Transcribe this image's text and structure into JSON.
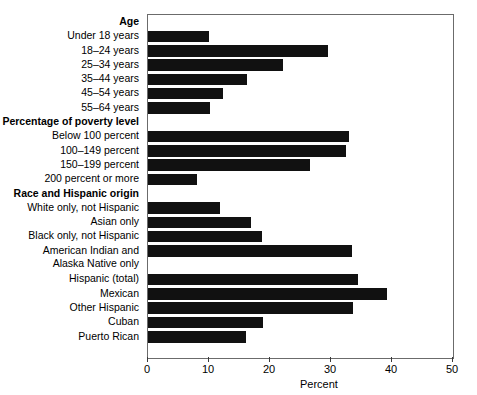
{
  "chart_data": {
    "type": "bar",
    "orientation": "horizontal",
    "title": "",
    "xlabel": "Percent",
    "ylabel": "",
    "xlim": [
      0,
      50
    ],
    "xticks": [
      0,
      10,
      20,
      30,
      40,
      50
    ],
    "grid": false,
    "legend": false,
    "categories": [
      "Age",
      "Under 18 years",
      "18–24 years",
      "25–34 years",
      "35–44 years",
      "45–54 years",
      "55–64 years",
      "Percentage of poverty level",
      "Below 100 percent",
      "100–149 percent",
      "150–199 percent",
      "200 percent or more",
      "Race and Hispanic origin",
      "White only, not Hispanic",
      "Asian only",
      "Black only, not Hispanic",
      "American Indian and Alaska Native only",
      "Hispanic (total)",
      "Mexican",
      "Other Hispanic",
      "Cuban",
      "Puerto Rican"
    ],
    "values": [
      null,
      10.0,
      29.5,
      22.1,
      16.2,
      12.3,
      10.2,
      null,
      33.0,
      32.5,
      26.5,
      8.0,
      null,
      11.8,
      16.9,
      18.7,
      33.4,
      34.4,
      39.2,
      33.6,
      18.9,
      16.0
    ],
    "bar_color": "#111111"
  },
  "rows": [
    {
      "label": "Age",
      "label2": null,
      "group": true,
      "value": null,
      "two_line": false
    },
    {
      "label": "Under 18 years",
      "label2": null,
      "group": false,
      "value": 10.0,
      "two_line": false
    },
    {
      "label": "18–24 years",
      "label2": null,
      "group": false,
      "value": 29.5,
      "two_line": false
    },
    {
      "label": "25–34 years",
      "label2": null,
      "group": false,
      "value": 22.1,
      "two_line": false
    },
    {
      "label": "35–44 years",
      "label2": null,
      "group": false,
      "value": 16.2,
      "two_line": false
    },
    {
      "label": "45–54 years",
      "label2": null,
      "group": false,
      "value": 12.3,
      "two_line": false
    },
    {
      "label": "55–64 years",
      "label2": null,
      "group": false,
      "value": 10.2,
      "two_line": false
    },
    {
      "label": "Percentage of poverty level",
      "label2": null,
      "group": true,
      "value": null,
      "two_line": false
    },
    {
      "label": "Below 100 percent",
      "label2": null,
      "group": false,
      "value": 33.0,
      "two_line": false
    },
    {
      "label": "100–149 percent",
      "label2": null,
      "group": false,
      "value": 32.5,
      "two_line": false
    },
    {
      "label": "150–199 percent",
      "label2": null,
      "group": false,
      "value": 26.5,
      "two_line": false
    },
    {
      "label": "200 percent or more",
      "label2": null,
      "group": false,
      "value": 8.0,
      "two_line": false
    },
    {
      "label": "Race and Hispanic origin",
      "label2": null,
      "group": true,
      "value": null,
      "two_line": false
    },
    {
      "label": "White only, not Hispanic",
      "label2": null,
      "group": false,
      "value": 11.8,
      "two_line": false
    },
    {
      "label": "Asian only",
      "label2": null,
      "group": false,
      "value": 16.9,
      "two_line": false
    },
    {
      "label": "Black only, not Hispanic",
      "label2": null,
      "group": false,
      "value": 18.7,
      "two_line": false
    },
    {
      "label": "American Indian and",
      "label2": "Alaska Native only",
      "group": false,
      "value": 33.4,
      "two_line": true
    },
    {
      "label": "Hispanic (total)",
      "label2": null,
      "group": false,
      "value": 34.4,
      "two_line": false
    },
    {
      "label": "Mexican",
      "label2": null,
      "group": false,
      "value": 39.2,
      "two_line": false
    },
    {
      "label": "Other Hispanic",
      "label2": null,
      "group": false,
      "value": 33.6,
      "two_line": false
    },
    {
      "label": "Cuban",
      "label2": null,
      "group": false,
      "value": 18.9,
      "two_line": false
    },
    {
      "label": "Puerto Rican",
      "label2": null,
      "group": false,
      "value": 16.0,
      "two_line": false
    }
  ],
  "axis": {
    "title": "Percent",
    "ticks": [
      "0",
      "10",
      "20",
      "30",
      "40",
      "50"
    ]
  }
}
